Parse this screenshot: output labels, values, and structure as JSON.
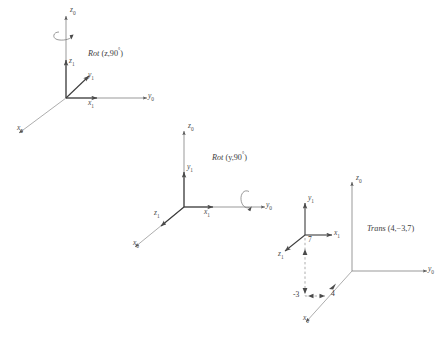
{
  "figure": {
    "background": "#ffffff",
    "stroke_color": "#6e6e6e",
    "text_color": "#4a4a4a"
  },
  "frames": [
    {
      "id": "frame-rot-z",
      "operation_prefix": "Rot",
      "operation_args": "(z,90",
      "operation_degree": "°",
      "operation_close": ")",
      "operation_full": "Rot (z,90°)",
      "axes": [
        {
          "name": "z0-axis",
          "label": "z",
          "sub": "0"
        },
        {
          "name": "y0-axis",
          "label": "y",
          "sub": "0"
        },
        {
          "name": "x0-axis",
          "label": "x",
          "sub": "0"
        },
        {
          "name": "z1-axis",
          "label": "z",
          "sub": "1"
        },
        {
          "name": "y1-axis",
          "label": "y",
          "sub": "1"
        },
        {
          "name": "x1-axis",
          "label": "x",
          "sub": "1"
        }
      ],
      "rotation_about": "z0"
    },
    {
      "id": "frame-rot-y",
      "operation_prefix": "Rot",
      "operation_args": "(y,90",
      "operation_degree": "°",
      "operation_close": ")",
      "operation_full": "Rot (y,90°)",
      "axes": [
        {
          "name": "z0-axis",
          "label": "z",
          "sub": "0"
        },
        {
          "name": "y0-axis",
          "label": "y",
          "sub": "0"
        },
        {
          "name": "x0-axis",
          "label": "x",
          "sub": "0"
        },
        {
          "name": "z1-axis",
          "label": "z",
          "sub": "1"
        },
        {
          "name": "y1-axis",
          "label": "y",
          "sub": "1"
        },
        {
          "name": "x1-axis",
          "label": "x",
          "sub": "1"
        }
      ],
      "rotation_about": "y0"
    },
    {
      "id": "frame-trans",
      "operation_prefix": "Trans",
      "operation_args": "(4,−3,7)",
      "operation_degree": "",
      "operation_close": "",
      "operation_full": "Trans (4,−3,7)",
      "axes": [
        {
          "name": "z0-axis",
          "label": "z",
          "sub": "0"
        },
        {
          "name": "y0-axis",
          "label": "y",
          "sub": "0"
        },
        {
          "name": "x0-axis",
          "label": "x",
          "sub": "0"
        },
        {
          "name": "z1-axis",
          "label": "z",
          "sub": "1"
        },
        {
          "name": "y1-axis",
          "label": "y",
          "sub": "1"
        },
        {
          "name": "x1-axis",
          "label": "x",
          "sub": "1"
        }
      ],
      "dimensions": [
        {
          "name": "dim-z",
          "value": "7"
        },
        {
          "name": "dim-y",
          "value": "-3"
        },
        {
          "name": "dim-x",
          "value": "4"
        }
      ]
    }
  ]
}
